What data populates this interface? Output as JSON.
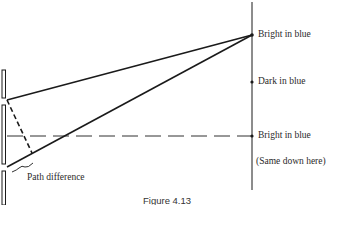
{
  "figure": {
    "caption": "Figure 4.13"
  },
  "screen": {
    "labels": [
      {
        "text": "Bright in blue",
        "y": 35
      },
      {
        "text": "Dark in blue",
        "y": 82
      },
      {
        "text": "Bright in blue",
        "y": 136
      },
      {
        "text": "(Same down here)",
        "y": 162
      }
    ]
  },
  "slits": {
    "path_difference_label": "Path difference"
  },
  "colors": {
    "line": "#1a1a1a",
    "text": "#2a2a2a",
    "background": "#ffffff"
  }
}
